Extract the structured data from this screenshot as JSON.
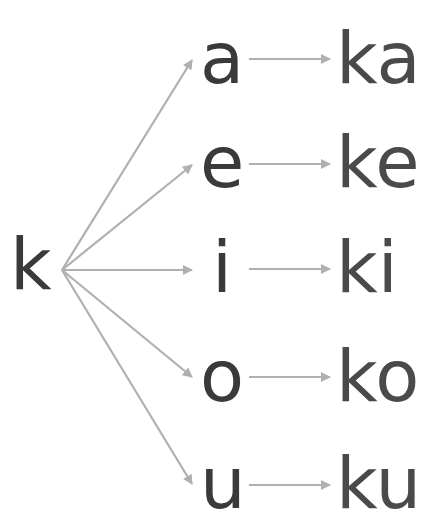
{
  "diagram": {
    "source": {
      "label": "k"
    },
    "colors": {
      "text": "#3a3a3a",
      "combo_text": "#4a4a4a",
      "arrow": "#b0b0b0"
    },
    "rows": [
      {
        "vowel": "a",
        "result": "ka"
      },
      {
        "vowel": "e",
        "result": "ke"
      },
      {
        "vowel": "i",
        "result": "ki"
      },
      {
        "vowel": "o",
        "result": "ko"
      },
      {
        "vowel": "u",
        "result": "ku"
      }
    ]
  }
}
